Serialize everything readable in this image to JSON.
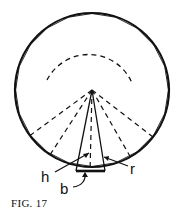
{
  "figure": {
    "caption": "FIG. 17",
    "labels": {
      "h": "h",
      "b": "b",
      "r": "r"
    }
  },
  "colors": {
    "stroke": "#111111",
    "background": "#ffffff"
  }
}
